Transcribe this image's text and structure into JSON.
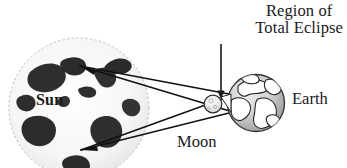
{
  "diagram": {
    "title_label": "Region of Total Eclipse",
    "labels": {
      "region_line1": "Region of",
      "region_line2": "Total Eclipse",
      "sun": "Sun",
      "moon": "Moon",
      "earth": "Earth"
    },
    "colors": {
      "background": "#ffffff",
      "ink": "#1a1a1a",
      "sun_fill": "#f7f7f7",
      "sun_spot": "#2b2b2b",
      "earth_fill": "#cfcfcf",
      "earth_land": "#ffffff",
      "moon_fill": "#ececec",
      "ray_line": "#111111"
    },
    "bodies": [
      {
        "name": "sun",
        "cx": 79,
        "cy": 108,
        "r": 71
      },
      {
        "name": "moon",
        "cx": 213,
        "cy": 104,
        "r": 9
      },
      {
        "name": "earth",
        "cx": 256,
        "cy": 103,
        "r": 29
      }
    ],
    "pointer": {
      "name": "region-of-total-eclipse-arrow",
      "x": 221,
      "y_start": 44,
      "y_end": 99
    },
    "rays": [
      {
        "from": [
          80,
          66
        ],
        "to": [
          233,
          112
        ]
      },
      {
        "from": [
          80,
          66
        ],
        "to": [
          229,
          94
        ]
      },
      {
        "from": [
          81,
          150
        ],
        "to": [
          233,
          95
        ]
      },
      {
        "from": [
          81,
          150
        ],
        "to": [
          229,
          113
        ]
      }
    ]
  }
}
